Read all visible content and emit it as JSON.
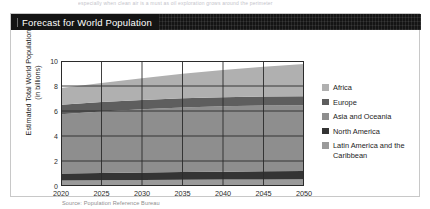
{
  "page_bleed_text": "especially when clean air is a must as oil exploration grows around the perimeter",
  "figure": {
    "title": "Forecast for World Population",
    "source": "Source: Population Reference Bureau"
  },
  "chart_data": {
    "type": "area",
    "stacked": true,
    "title": "Forecast for World Population",
    "xlabel": "",
    "ylabel": "Estimated Total World Population (in billions)",
    "ylabel_line1": "Estimated Total World Population",
    "ylabel_line2": "(in billions)",
    "x": [
      2020,
      2025,
      2030,
      2035,
      2040,
      2045,
      2050
    ],
    "xlim": [
      2020,
      2050
    ],
    "ylim": [
      0,
      10
    ],
    "xticks": [
      "2020",
      "2025",
      "2030",
      "2035",
      "2040",
      "2045",
      "2050"
    ],
    "yticks": [
      "0",
      "2",
      "4",
      "6",
      "8",
      "10"
    ],
    "grid": true,
    "legend_position": "right",
    "series": [
      {
        "name": "Latin America and the Caribbean",
        "color": "#9a9a9a",
        "values": [
          0.45,
          0.47,
          0.49,
          0.51,
          0.52,
          0.53,
          0.54
        ]
      },
      {
        "name": "North America",
        "color": "#343434",
        "values": [
          0.55,
          0.57,
          0.59,
          0.61,
          0.63,
          0.65,
          0.67
        ]
      },
      {
        "name": "Asia and Oceania",
        "color": "#8e8e8e",
        "values": [
          4.75,
          4.93,
          5.07,
          5.17,
          5.23,
          5.26,
          5.26
        ]
      },
      {
        "name": "Europe",
        "color": "#5e5e5e",
        "values": [
          0.75,
          0.75,
          0.74,
          0.74,
          0.73,
          0.72,
          0.71
        ]
      },
      {
        "name": "Africa",
        "color": "#b0b0b0",
        "values": [
          1.34,
          1.53,
          1.74,
          1.96,
          2.18,
          2.39,
          2.58
        ]
      }
    ],
    "totals": [
      7.84,
      8.25,
      8.63,
      8.99,
      9.29,
      9.55,
      9.76
    ],
    "legend_order": [
      "Africa",
      "Europe",
      "Asia and Oceania",
      "North America",
      "Latin America and the Caribbean"
    ]
  },
  "legend": {
    "items": [
      {
        "label": "Africa",
        "color": "#b0b0b0"
      },
      {
        "label": "Europe",
        "color": "#5e5e5e"
      },
      {
        "label": "Asia and Oceania",
        "color": "#8e8e8e"
      },
      {
        "label": "North America",
        "color": "#343434"
      },
      {
        "label": "Latin America and the Caribbean",
        "color": "#9a9a9a"
      }
    ]
  },
  "colors": {
    "header_bar": "#141414",
    "card_border": "#c8c8c8",
    "axis": "#2b2b2b",
    "text": "#1c1c1c",
    "source_text": "#8e8e8e"
  }
}
